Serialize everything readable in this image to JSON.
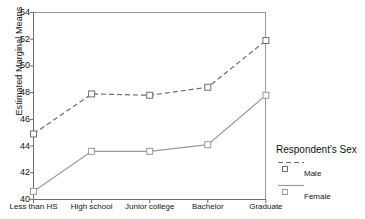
{
  "chart_data": {
    "type": "line",
    "title": "",
    "xlabel": "",
    "ylabel": "Estimated Marginal Means",
    "categories": [
      "Less than HS",
      "High school",
      "Junior college",
      "Bachelor",
      "Graduate"
    ],
    "ylim": [
      40,
      54
    ],
    "yticks": [
      40,
      42,
      44,
      46,
      48,
      50,
      52,
      54
    ],
    "grid": false,
    "legend_position": "right",
    "legend_title": "Respondent's Sex",
    "series": [
      {
        "name": "Male",
        "values": [
          44.9,
          47.9,
          47.8,
          48.4,
          51.9
        ],
        "linestyle": "dashed",
        "marker": "square",
        "color": "#6e6e6e"
      },
      {
        "name": "Female",
        "values": [
          40.6,
          43.6,
          43.6,
          44.1,
          47.8
        ],
        "linestyle": "solid",
        "marker": "square",
        "color": "#9a9a9a"
      }
    ]
  },
  "axes": {
    "y_title": "Estimated Marginal Means",
    "y_tick_labels": [
      "54",
      "52",
      "50",
      "48",
      "46",
      "44",
      "42",
      "40"
    ],
    "x_tick_labels": [
      "Less than HS",
      "High school",
      "Junior college",
      "Bachelor",
      "Graduate"
    ]
  },
  "legend": {
    "title": "Respondent's Sex",
    "items": [
      {
        "label": "Male",
        "marker": "open-square",
        "line": "dashed"
      },
      {
        "label": "Female",
        "marker": "open-square",
        "line": "solid"
      }
    ]
  },
  "colors": {
    "male_line": "#6e6e6e",
    "female_line": "#9a9a9a",
    "axis": "#6d6d6d",
    "text": "#141414",
    "background": "#ffffff"
  }
}
